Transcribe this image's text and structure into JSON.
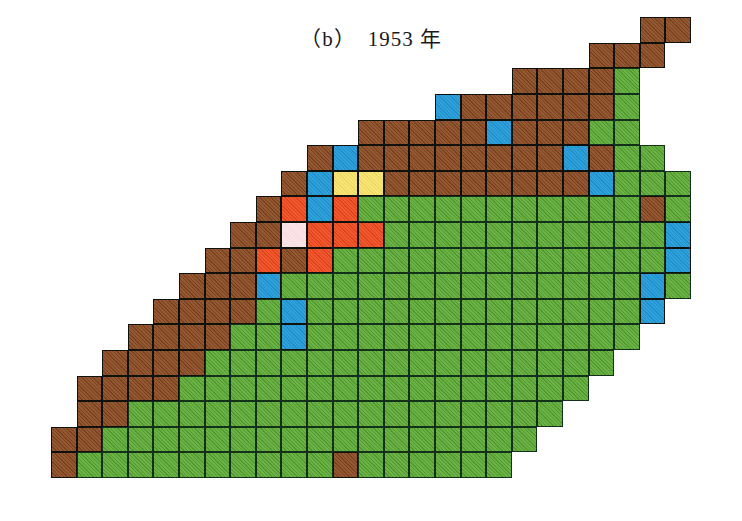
{
  "figure": {
    "panel_label": "（b）",
    "year_label": "1953 年",
    "title": "（b）　1953 年"
  },
  "colors": {
    "brown": "#8b4a22",
    "green": "#5aaa32",
    "blue": "#219ad8",
    "red": "#f04a1e",
    "yellow": "#f9e36a",
    "pink": "#fbe2e6",
    "grid_line": "#10100c",
    "background": "#ffffff"
  },
  "chart_data": {
    "type": "heatmap",
    "title": "（b）　1953 年",
    "xlabel": "",
    "ylabel": "",
    "grid": true,
    "legend_position": "none",
    "cell_size": 25.6,
    "origin_x": 51,
    "origin_y": 478,
    "n_cols": 25,
    "n_rows": 18,
    "categories": [
      "brown",
      "green",
      "blue",
      "red",
      "yellow",
      "pink"
    ],
    "category_counts": {
      "brown": 150,
      "green": 186,
      "blue": 18,
      "red": 9,
      "yellow": 2,
      "pink": 1
    },
    "rows": [
      {
        "r": 0,
        "start": 0,
        "cells": [
          "brown",
          "green",
          "green",
          "green",
          "green",
          "green",
          "green",
          "green",
          "green",
          "green",
          "green",
          "brown",
          "green",
          "green",
          "green",
          "green",
          "green",
          "green"
        ]
      },
      {
        "r": 1,
        "start": 0,
        "cells": [
          "brown",
          "brown",
          "green",
          "green",
          "green",
          "green",
          "green",
          "green",
          "green",
          "green",
          "green",
          "green",
          "green",
          "green",
          "green",
          "green",
          "green",
          "green",
          "green"
        ]
      },
      {
        "r": 2,
        "start": 1,
        "cells": [
          "brown",
          "brown",
          "green",
          "green",
          "green",
          "green",
          "green",
          "green",
          "green",
          "green",
          "green",
          "green",
          "green",
          "green",
          "green",
          "green",
          "green",
          "green",
          "green"
        ]
      },
      {
        "r": 3,
        "start": 1,
        "cells": [
          "brown",
          "brown",
          "brown",
          "brown",
          "green",
          "green",
          "green",
          "green",
          "green",
          "green",
          "green",
          "green",
          "green",
          "green",
          "green",
          "green",
          "green",
          "green",
          "green",
          "green"
        ]
      },
      {
        "r": 4,
        "start": 2,
        "cells": [
          "brown",
          "brown",
          "brown",
          "brown",
          "green",
          "green",
          "green",
          "green",
          "green",
          "green",
          "green",
          "green",
          "green",
          "green",
          "green",
          "green",
          "green",
          "green",
          "green",
          "green"
        ]
      },
      {
        "r": 5,
        "start": 3,
        "cells": [
          "brown",
          "brown",
          "brown",
          "brown",
          "green",
          "green",
          "blue",
          "green",
          "green",
          "green",
          "green",
          "green",
          "green",
          "green",
          "green",
          "green",
          "green",
          "green",
          "green",
          "green"
        ]
      },
      {
        "r": 6,
        "start": 4,
        "cells": [
          "brown",
          "brown",
          "brown",
          "brown",
          "green",
          "blue",
          "green",
          "green",
          "green",
          "green",
          "green",
          "green",
          "green",
          "green",
          "green",
          "green",
          "green",
          "green",
          "green",
          "blue"
        ]
      },
      {
        "r": 7,
        "start": 5,
        "cells": [
          "brown",
          "brown",
          "brown",
          "blue",
          "green",
          "green",
          "green",
          "green",
          "green",
          "green",
          "green",
          "green",
          "green",
          "green",
          "green",
          "green",
          "green",
          "green",
          "blue",
          "green"
        ]
      },
      {
        "r": 8,
        "start": 6,
        "cells": [
          "brown",
          "brown",
          "red",
          "brown",
          "red",
          "green",
          "green",
          "green",
          "green",
          "green",
          "green",
          "green",
          "green",
          "green",
          "green",
          "green",
          "green",
          "green",
          "blue"
        ]
      },
      {
        "r": 9,
        "start": 7,
        "cells": [
          "brown",
          "brown",
          "pink",
          "red",
          "red",
          "red",
          "green",
          "green",
          "green",
          "green",
          "green",
          "green",
          "green",
          "green",
          "green",
          "green",
          "green",
          "blue"
        ]
      },
      {
        "r": 10,
        "start": 8,
        "cells": [
          "brown",
          "red",
          "blue",
          "red",
          "green",
          "green",
          "green",
          "green",
          "green",
          "green",
          "green",
          "green",
          "green",
          "green",
          "green",
          "brown",
          "green"
        ]
      },
      {
        "r": 11,
        "start": 9,
        "cells": [
          "brown",
          "blue",
          "yellow",
          "yellow",
          "brown",
          "brown",
          "brown",
          "brown",
          "brown",
          "brown",
          "brown",
          "brown",
          "blue",
          "green",
          "green",
          "green"
        ]
      },
      {
        "r": 12,
        "start": 10,
        "cells": [
          "brown",
          "blue",
          "brown",
          "brown",
          "brown",
          "brown",
          "brown",
          "brown",
          "brown",
          "brown",
          "blue",
          "brown",
          "green",
          "green"
        ]
      },
      {
        "r": 13,
        "start": 12,
        "cells": [
          "brown",
          "brown",
          "brown",
          "brown",
          "brown",
          "blue",
          "brown",
          "brown",
          "brown",
          "green",
          "green"
        ]
      },
      {
        "r": 14,
        "start": 15,
        "cells": [
          "blue",
          "brown",
          "brown",
          "brown",
          "brown",
          "brown",
          "brown",
          "green"
        ]
      },
      {
        "r": 15,
        "start": 18,
        "cells": [
          "brown",
          "brown",
          "brown",
          "brown",
          "green"
        ]
      },
      {
        "r": 16,
        "start": 21,
        "cells": [
          "brown",
          "brown",
          "brown"
        ]
      },
      {
        "r": 17,
        "start": 23,
        "cells": [
          "brown",
          "brown"
        ]
      }
    ]
  }
}
